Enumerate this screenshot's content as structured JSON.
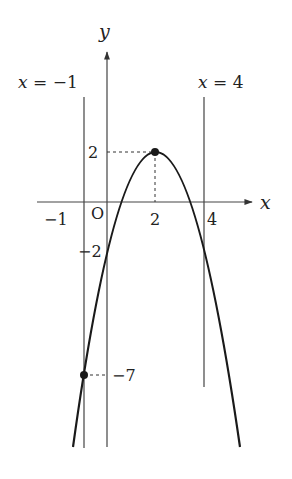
{
  "diagram": {
    "type": "function-graph",
    "axes": {
      "x_label": "x",
      "y_label": "y",
      "origin_label": "O"
    },
    "x_ticks": [
      {
        "value": -1,
        "label": "−1"
      },
      {
        "value": 2,
        "label": "2"
      },
      {
        "value": 4,
        "label": "4"
      }
    ],
    "y_ticks": [
      {
        "value": 2,
        "label": "2"
      },
      {
        "value": -2,
        "label": "−2"
      },
      {
        "value": -7,
        "label": "−7"
      }
    ],
    "vertical_lines": [
      {
        "x": -1,
        "label": "x = −1"
      },
      {
        "x": 4,
        "label": "x = 4"
      }
    ],
    "points": [
      {
        "name": "vertex",
        "x": 2,
        "y": 2
      },
      {
        "name": "left-intersection",
        "x": -1,
        "y": -7
      }
    ],
    "curve": {
      "equation": "y = -(x-2)^2 + 2",
      "shape": "parabola opening downward"
    }
  }
}
